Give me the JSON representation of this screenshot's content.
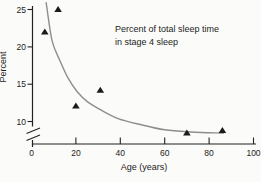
{
  "chart_data": {
    "type": "scatter",
    "title": "Percent of total sleep time in stage 4 sleep",
    "annotation": {
      "line1": "Percent of total sleep time",
      "line2": "in stage 4 sleep"
    },
    "xlabel": "Age (years)",
    "ylabel": "Percent",
    "x_ticks": [
      0,
      20,
      40,
      60,
      80,
      100
    ],
    "y_ticks": [
      10,
      15,
      20,
      25
    ],
    "xlim": [
      0,
      100
    ],
    "ylim": [
      6.5,
      26
    ],
    "y_axis_break": true,
    "grid": false,
    "legend": false,
    "marker": "filled-triangle",
    "points": [
      [
        6,
        22
      ],
      [
        12,
        25
      ],
      [
        20,
        12.1
      ],
      [
        31,
        14.2
      ],
      [
        70,
        8.5
      ],
      [
        86,
        8.8
      ]
    ],
    "trend_curve": [
      [
        6.6,
        25.9
      ],
      [
        9.3,
        20.8
      ],
      [
        12.9,
        18.1
      ],
      [
        16.5,
        15.8
      ],
      [
        20.6,
        14.0
      ],
      [
        25,
        12.7
      ],
      [
        31,
        11.6
      ],
      [
        39,
        10.4
      ],
      [
        49,
        9.6
      ],
      [
        60,
        8.9
      ],
      [
        72,
        8.6
      ],
      [
        86.5,
        8.45
      ]
    ],
    "colors": {
      "background": "#fbfbf9",
      "curve": "#8e8e8c",
      "marker": "#1b1b1b",
      "axis": "#222222",
      "text": "#1c1c1c"
    }
  }
}
